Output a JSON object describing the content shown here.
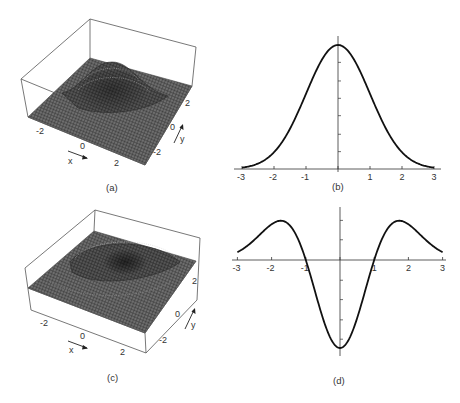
{
  "figure": {
    "panels": [
      {
        "id": "a",
        "caption": "(a)",
        "type": "surface3d",
        "description": "Gaussian bump surface",
        "x_ticks": [
          "-2",
          "0",
          "2"
        ],
        "y_ticks": [
          "-2",
          "0",
          "2"
        ],
        "x_label": "x",
        "y_label": "y"
      },
      {
        "id": "b",
        "caption": "(b)",
        "type": "line",
        "description": "1D Gaussian profile"
      },
      {
        "id": "c",
        "caption": "(c)",
        "type": "surface3d",
        "description": "Laplacian of Gaussian (Mexican hat, inverted) surface",
        "x_ticks": [
          "-2",
          "0",
          "2"
        ],
        "y_ticks": [
          "-2",
          "0",
          "2"
        ],
        "x_label": "x",
        "y_label": "y"
      },
      {
        "id": "d",
        "caption": "(d)",
        "type": "line",
        "description": "1D second derivative of Gaussian profile"
      }
    ],
    "colors": {
      "ink": "#222222",
      "mesh_dark": "#3a3a3a",
      "mesh_light": "#8a8a8a",
      "box": "#555555"
    }
  },
  "chart_data": [
    {
      "type": "line",
      "title": "(b)",
      "xlabel": "",
      "ylabel": "",
      "x_ticks": [
        "-3",
        "-2",
        "-1",
        "0",
        "1",
        "2",
        "3"
      ],
      "xlim": [
        -3,
        3
      ],
      "ylim": [
        0,
        1.05
      ],
      "grid": false,
      "series": [
        {
          "name": "G(x)",
          "x": [
            -3,
            -2.5,
            -2,
            -1.5,
            -1,
            -0.5,
            0,
            0.5,
            1,
            1.5,
            2,
            2.5,
            3
          ],
          "values": [
            0.011,
            0.044,
            0.135,
            0.325,
            0.607,
            0.882,
            1.0,
            0.882,
            0.607,
            0.325,
            0.135,
            0.044,
            0.011
          ]
        }
      ]
    },
    {
      "type": "line",
      "title": "(d)",
      "xlabel": "",
      "ylabel": "",
      "x_ticks": [
        "-3",
        "-2",
        "-1",
        "0",
        "1",
        "2",
        "3"
      ],
      "xlim": [
        -3,
        3
      ],
      "ylim": [
        -1.05,
        0.5
      ],
      "grid": false,
      "series": [
        {
          "name": "G''(x)",
          "x": [
            -3,
            -2.5,
            -2,
            -1.5,
            -1.41,
            -1,
            -0.5,
            0,
            0.5,
            1,
            1.41,
            1.5,
            2,
            2.5,
            3
          ],
          "values": [
            0.089,
            0.231,
            0.406,
            0.406,
            0.446,
            0.0,
            -0.662,
            -1.0,
            -0.662,
            0.0,
            0.446,
            0.406,
            0.406,
            0.231,
            0.089
          ]
        }
      ]
    }
  ]
}
